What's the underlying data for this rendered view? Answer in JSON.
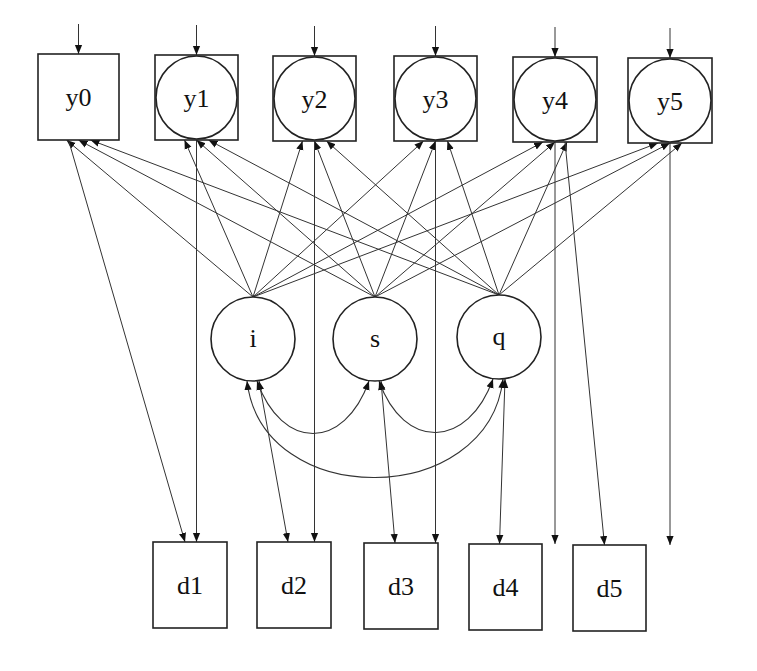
{
  "diagram": {
    "type": "path-diagram",
    "observed_top": [
      {
        "id": "y0",
        "label": "y0",
        "shape": "box",
        "x": 38,
        "y": 54,
        "w": 81,
        "h": 86
      },
      {
        "id": "y1",
        "label": "y1",
        "shape": "box-circle",
        "x": 155,
        "y": 55,
        "w": 83,
        "h": 85
      },
      {
        "id": "y2",
        "label": "y2",
        "shape": "box-circle",
        "x": 273,
        "y": 56,
        "w": 83,
        "h": 85
      },
      {
        "id": "y3",
        "label": "y3",
        "shape": "box-circle",
        "x": 394,
        "y": 56,
        "w": 83,
        "h": 85
      },
      {
        "id": "y4",
        "label": "y4",
        "shape": "box-circle",
        "x": 513,
        "y": 57,
        "w": 84,
        "h": 85
      },
      {
        "id": "y5",
        "label": "y5",
        "shape": "box-circle",
        "x": 628,
        "y": 58,
        "w": 84,
        "h": 85
      }
    ],
    "latent_factors": [
      {
        "id": "i",
        "label": "i",
        "cx": 253,
        "cy": 339,
        "r": 42
      },
      {
        "id": "s",
        "label": "s",
        "cx": 375,
        "cy": 339,
        "r": 42
      },
      {
        "id": "q",
        "label": "q",
        "cx": 499,
        "cy": 337,
        "r": 42
      }
    ],
    "observed_bottom": [
      {
        "id": "d1",
        "label": "d1",
        "x": 153,
        "y": 542,
        "w": 74,
        "h": 86
      },
      {
        "id": "d2",
        "label": "d2",
        "x": 257,
        "y": 542,
        "w": 74,
        "h": 86
      },
      {
        "id": "d3",
        "label": "d3",
        "x": 364,
        "y": 543,
        "w": 74,
        "h": 86
      },
      {
        "id": "d4",
        "label": "d4",
        "x": 469,
        "y": 544,
        "w": 73,
        "h": 86
      },
      {
        "id": "d5",
        "label": "d5",
        "x": 573,
        "y": 545,
        "w": 73,
        "h": 86
      }
    ],
    "residual_arrows": [
      "y0",
      "y1",
      "y2",
      "y3",
      "y4",
      "y5"
    ],
    "loadings": [
      {
        "from": "i",
        "to": "y0"
      },
      {
        "from": "s",
        "to": "y0"
      },
      {
        "from": "q",
        "to": "y0"
      },
      {
        "from": "i",
        "to": "y1"
      },
      {
        "from": "s",
        "to": "y1"
      },
      {
        "from": "q",
        "to": "y1"
      },
      {
        "from": "i",
        "to": "y2"
      },
      {
        "from": "s",
        "to": "y2"
      },
      {
        "from": "q",
        "to": "y2"
      },
      {
        "from": "i",
        "to": "y3"
      },
      {
        "from": "s",
        "to": "y3"
      },
      {
        "from": "q",
        "to": "y3"
      },
      {
        "from": "i",
        "to": "y4"
      },
      {
        "from": "s",
        "to": "y4"
      },
      {
        "from": "q",
        "to": "y4"
      },
      {
        "from": "i",
        "to": "y5"
      },
      {
        "from": "s",
        "to": "y5"
      },
      {
        "from": "q",
        "to": "y5"
      }
    ],
    "regressions": [
      {
        "from": "y0",
        "to": "d1"
      },
      {
        "from": "y1",
        "to": "d1"
      },
      {
        "from": "y2",
        "to": "d2"
      },
      {
        "from": "y3",
        "to": "d3"
      },
      {
        "from": "y4",
        "to": "d4"
      },
      {
        "from": "y4",
        "to": "d5"
      },
      {
        "from": "y5",
        "to": "d5"
      }
    ],
    "double_headed": [
      {
        "a": "i",
        "b": "d2"
      },
      {
        "a": "s",
        "b": "d3"
      },
      {
        "a": "q",
        "b": "d4"
      }
    ],
    "covariances": [
      {
        "a": "i",
        "b": "s"
      },
      {
        "a": "s",
        "b": "q"
      },
      {
        "a": "i",
        "b": "q"
      }
    ],
    "colors": {
      "stroke": "#222222",
      "background": "#ffffff"
    }
  }
}
